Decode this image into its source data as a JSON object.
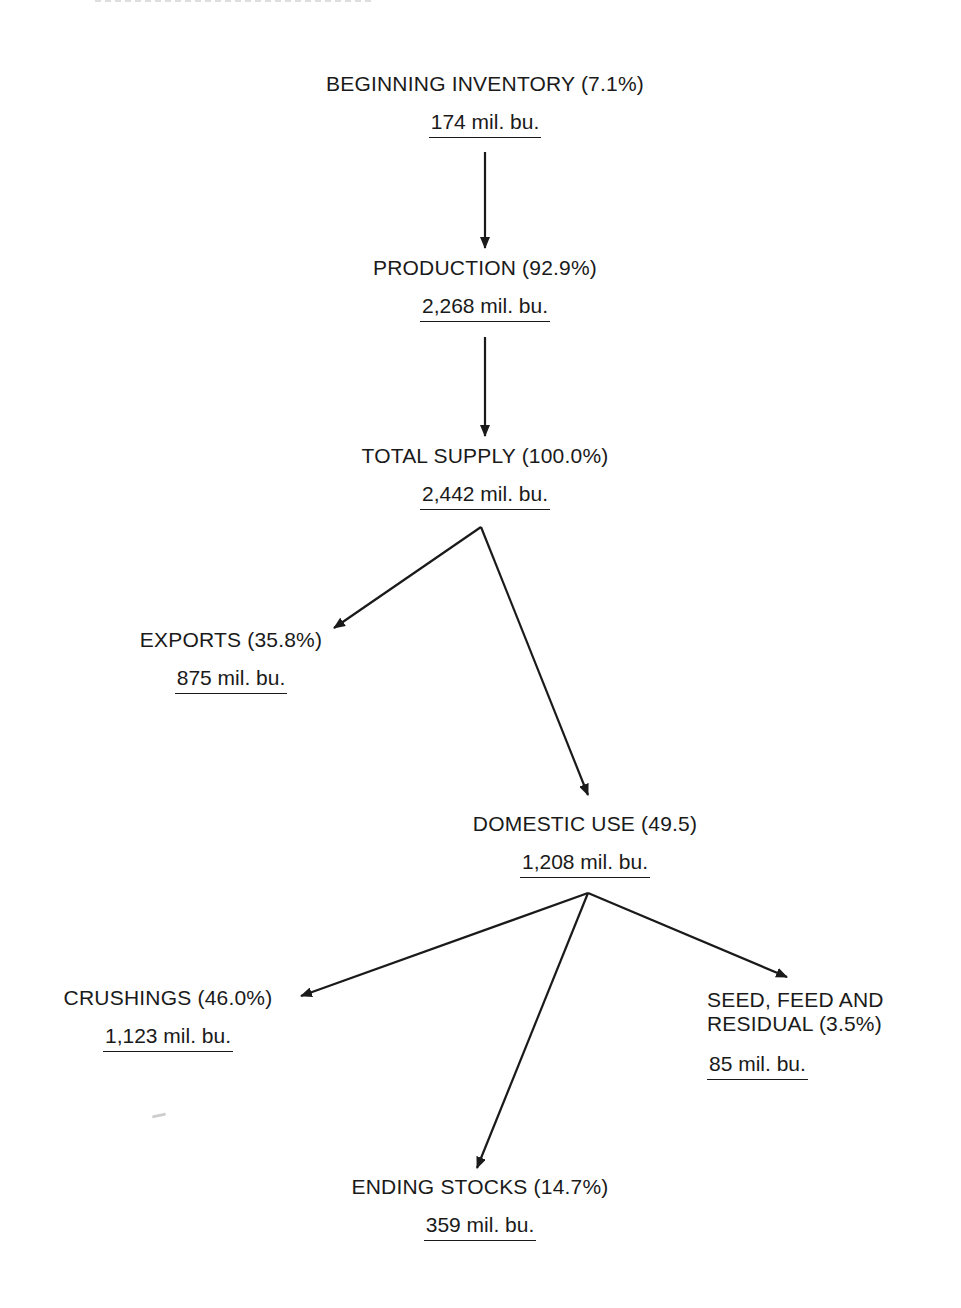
{
  "diagram": {
    "type": "flow",
    "title_cropped": true,
    "nodes": {
      "beginning_inventory": {
        "label": "BEGINNING INVENTORY (7.1%)",
        "value": "174 mil. bu.",
        "percent": 7.1,
        "amount": 174
      },
      "production": {
        "label": "PRODUCTION (92.9%)",
        "value": "2,268 mil. bu.",
        "percent": 92.9,
        "amount": 2268
      },
      "total_supply": {
        "label": "TOTAL SUPPLY (100.0%)",
        "value": "2,442 mil. bu.",
        "percent": 100.0,
        "amount": 2442
      },
      "exports": {
        "label": "EXPORTS (35.8%)",
        "value": "875 mil. bu.",
        "percent": 35.8,
        "amount": 875
      },
      "domestic_use": {
        "label": "DOMESTIC USE (49.5)",
        "value": "1,208 mil. bu.",
        "percent": 49.5,
        "amount": 1208
      },
      "crushings": {
        "label": "CRUSHINGS (46.0%)",
        "value": "1,123 mil. bu.",
        "percent": 46.0,
        "amount": 1123
      },
      "seed_feed_residual": {
        "label_line1": "SEED, FEED AND",
        "label_line2": "RESIDUAL (3.5%)",
        "value": "85 mil. bu.",
        "percent": 3.5,
        "amount": 85
      },
      "ending_stocks": {
        "label": "ENDING STOCKS (14.7%)",
        "value": "359 mil. bu.",
        "percent": 14.7,
        "amount": 359
      }
    },
    "edges": [
      {
        "from": "beginning_inventory",
        "to": "production"
      },
      {
        "from": "production",
        "to": "total_supply"
      },
      {
        "from": "total_supply",
        "to": "exports"
      },
      {
        "from": "total_supply",
        "to": "domestic_use"
      },
      {
        "from": "domestic_use",
        "to": "crushings"
      },
      {
        "from": "domestic_use",
        "to": "ending_stocks"
      },
      {
        "from": "domestic_use",
        "to": "seed_feed_residual"
      }
    ],
    "colors": {
      "ink": "#1a1a1a",
      "background": "#ffffff"
    }
  }
}
